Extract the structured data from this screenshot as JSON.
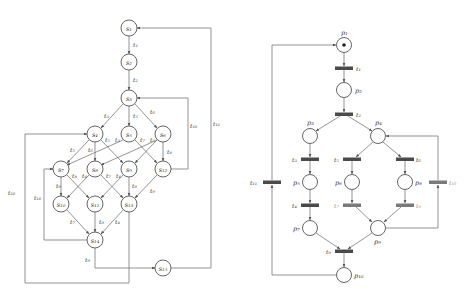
{
  "left_graph": {
    "title": "Reachability graph",
    "nodes": [
      {
        "id": "s1",
        "label": "s1",
        "x": 129,
        "y": 28
      },
      {
        "id": "s2",
        "label": "s2",
        "x": 129,
        "y": 62
      },
      {
        "id": "s3",
        "label": "s3",
        "x": 129,
        "y": 98
      },
      {
        "id": "s4",
        "label": "s4",
        "x": 95,
        "y": 134
      },
      {
        "id": "s5",
        "label": "s5",
        "x": 129,
        "y": 134
      },
      {
        "id": "s6",
        "label": "s6",
        "x": 163,
        "y": 134
      },
      {
        "id": "s7",
        "label": "s7",
        "x": 61,
        "y": 169
      },
      {
        "id": "s8",
        "label": "s8",
        "x": 95,
        "y": 169
      },
      {
        "id": "s9",
        "label": "s9",
        "x": 129,
        "y": 169
      },
      {
        "id": "s12",
        "label": "s12",
        "x": 163,
        "y": 169
      },
      {
        "id": "s10",
        "label": "s10",
        "x": 61,
        "y": 204
      },
      {
        "id": "s11",
        "label": "s11",
        "x": 95,
        "y": 204
      },
      {
        "id": "s13",
        "label": "s13",
        "x": 129,
        "y": 204
      },
      {
        "id": "s14",
        "label": "s14",
        "x": 95,
        "y": 240
      },
      {
        "id": "s15",
        "label": "s15",
        "x": 163,
        "y": 268
      }
    ],
    "edges": [
      {
        "from": "s1",
        "to": "s2",
        "label": "t1"
      },
      {
        "from": "s2",
        "to": "s3",
        "label": "t2"
      },
      {
        "from": "s3",
        "to": "s4",
        "label": "t3"
      },
      {
        "from": "s3",
        "to": "s5",
        "label": "t5"
      },
      {
        "from": "s3",
        "to": "s6",
        "label": "t6"
      },
      {
        "from": "s4",
        "to": "s7",
        "label": "t5"
      },
      {
        "from": "s4",
        "to": "s8",
        "label": "t6"
      },
      {
        "from": "s4",
        "to": "s9",
        "label": "t4"
      },
      {
        "from": "s5",
        "to": "s7",
        "label": "t3"
      },
      {
        "from": "s5",
        "to": "s12",
        "label": "t7"
      },
      {
        "from": "s6",
        "to": "s8",
        "label": "t3"
      },
      {
        "from": "s6",
        "to": "s9",
        "label": "t5"
      },
      {
        "from": "s6",
        "to": "s12",
        "label": "t8"
      },
      {
        "from": "s7",
        "to": "s10",
        "label": "t4"
      },
      {
        "from": "s7",
        "to": "s11",
        "label": "t8"
      },
      {
        "from": "s8",
        "to": "s10",
        "label": "t4"
      },
      {
        "from": "s8",
        "to": "s13",
        "label": "t7"
      },
      {
        "from": "s9",
        "to": "s11",
        "label": "t4"
      },
      {
        "from": "s9",
        "to": "s13",
        "label": "t8"
      },
      {
        "from": "s12",
        "to": "s13",
        "label": "t3"
      },
      {
        "from": "s10",
        "to": "s14",
        "label": "t7"
      },
      {
        "from": "s11",
        "to": "s14",
        "label": "t8"
      },
      {
        "from": "s13",
        "to": "s14",
        "label": "t4"
      },
      {
        "from": "s14",
        "to": "s15",
        "label": "t9"
      },
      {
        "from": "s12",
        "to": "s3",
        "label": "t10"
      },
      {
        "from": "s14",
        "to": "s7",
        "label": "t10"
      },
      {
        "from": "s13",
        "to": "s4",
        "label": "t10"
      },
      {
        "from": "s15",
        "to": "s1",
        "label": "t11"
      }
    ]
  },
  "right_net": {
    "title": "Petri net",
    "places": [
      {
        "id": "p1",
        "label": "p1",
        "x": 344,
        "y": 45,
        "tokens": 1
      },
      {
        "id": "p2",
        "label": "p2",
        "x": 344,
        "y": 90,
        "tokens": 0
      },
      {
        "id": "p3",
        "label": "p3",
        "x": 310,
        "y": 136,
        "tokens": 0
      },
      {
        "id": "p4",
        "label": "p4",
        "x": 378,
        "y": 136,
        "tokens": 0
      },
      {
        "id": "p5",
        "label": "p5",
        "x": 310,
        "y": 182,
        "tokens": 0
      },
      {
        "id": "p6",
        "label": "p6",
        "x": 352,
        "y": 182,
        "tokens": 0
      },
      {
        "id": "p8",
        "label": "p8",
        "x": 405,
        "y": 182,
        "tokens": 0
      },
      {
        "id": "p7",
        "label": "p7",
        "x": 310,
        "y": 228,
        "tokens": 0
      },
      {
        "id": "p9",
        "label": "p9",
        "x": 378,
        "y": 228,
        "tokens": 0
      },
      {
        "id": "p10",
        "label": "p10",
        "x": 344,
        "y": 275,
        "tokens": 0
      }
    ],
    "transitions": [
      {
        "id": "t1",
        "label": "t1"
      },
      {
        "id": "t2",
        "label": "t2"
      },
      {
        "id": "t3",
        "label": "t3"
      },
      {
        "id": "t4",
        "label": "t4"
      },
      {
        "id": "t5",
        "label": "t5"
      },
      {
        "id": "t6",
        "label": "t6"
      },
      {
        "id": "t7",
        "label": "t7"
      },
      {
        "id": "t8",
        "label": "t8"
      },
      {
        "id": "t9",
        "label": "t9"
      },
      {
        "id": "t10",
        "label": "t10"
      },
      {
        "id": "t11",
        "label": "t11"
      }
    ]
  }
}
